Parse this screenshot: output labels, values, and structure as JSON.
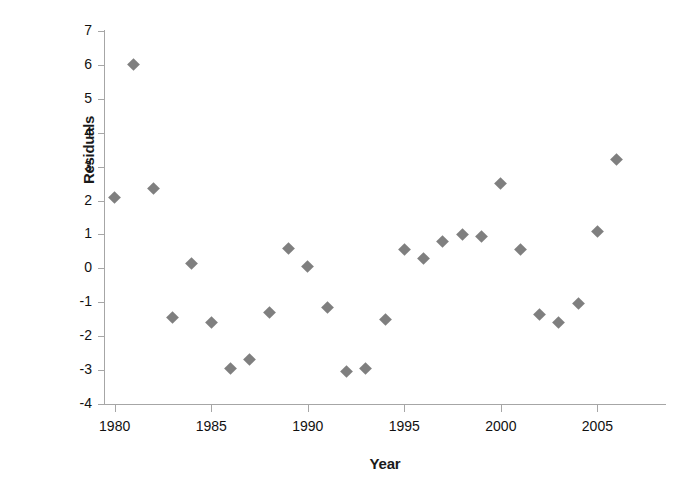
{
  "chart_data": {
    "type": "scatter",
    "title": "",
    "xlabel": "Year",
    "ylabel": "Residuals",
    "xlim": [
      1979.5,
      2008.5
    ],
    "ylim": [
      -4,
      7
    ],
    "grid": false,
    "legend_position": "none",
    "marker": {
      "shape": "diamond",
      "color": "#7f7f7f",
      "size": 9
    },
    "x_tick_labels": [
      "1980",
      "1985",
      "1990",
      "1995",
      "2000",
      "2005"
    ],
    "x_tick_values": [
      1980,
      1985,
      1990,
      1995,
      2000,
      2005
    ],
    "y_tick_labels": [
      "7",
      "6",
      "5",
      "4",
      "3",
      "2",
      "1",
      "0",
      "-1",
      "-2",
      "-3",
      "-4"
    ],
    "y_tick_values": [
      7,
      6,
      5,
      4,
      3,
      2,
      1,
      0,
      -1,
      -2,
      -3,
      -4
    ],
    "x": [
      1980,
      1981,
      1982,
      1983,
      1984,
      1985,
      1986,
      1987,
      1988,
      1989,
      1990,
      1991,
      1992,
      1993,
      1994,
      1995,
      1996,
      1997,
      1998,
      1999,
      2000,
      2001,
      2002,
      2003,
      2004,
      2005,
      2006
    ],
    "y": [
      2.1,
      6.0,
      2.35,
      -1.45,
      0.15,
      -1.6,
      -2.95,
      -2.7,
      -1.3,
      0.6,
      0.05,
      -1.15,
      -3.05,
      -2.95,
      -1.5,
      0.55,
      0.3,
      0.8,
      1.0,
      0.95,
      2.5,
      0.55,
      -1.35,
      -1.6,
      -1.05,
      1.1,
      3.2
    ],
    "points": [
      {
        "x": 1980,
        "y": 2.1
      },
      {
        "x": 1981,
        "y": 6.0
      },
      {
        "x": 1982,
        "y": 2.35
      },
      {
        "x": 1983,
        "y": -1.45
      },
      {
        "x": 1984,
        "y": 0.15
      },
      {
        "x": 1985,
        "y": -1.6
      },
      {
        "x": 1986,
        "y": -2.95
      },
      {
        "x": 1987,
        "y": -2.7
      },
      {
        "x": 1988,
        "y": -1.3
      },
      {
        "x": 1989,
        "y": 0.6
      },
      {
        "x": 1990,
        "y": 0.05
      },
      {
        "x": 1991,
        "y": -1.15
      },
      {
        "x": 1992,
        "y": -3.05
      },
      {
        "x": 1993,
        "y": -2.95
      },
      {
        "x": 1994,
        "y": -1.5
      },
      {
        "x": 1995,
        "y": 0.55
      },
      {
        "x": 1996,
        "y": 0.3
      },
      {
        "x": 1997,
        "y": 0.8
      },
      {
        "x": 1998,
        "y": 1.0
      },
      {
        "x": 1999,
        "y": 0.95
      },
      {
        "x": 2000,
        "y": 2.5
      },
      {
        "x": 2001,
        "y": 0.55
      },
      {
        "x": 2002,
        "y": -1.35
      },
      {
        "x": 2003,
        "y": -1.6
      },
      {
        "x": 2004,
        "y": -1.05
      },
      {
        "x": 2005,
        "y": 1.1
      },
      {
        "x": 2006,
        "y": 3.2
      }
    ]
  },
  "axis": {
    "x_title": "Year",
    "y_title": "Residuals",
    "line_color": "#a6a6a6"
  }
}
